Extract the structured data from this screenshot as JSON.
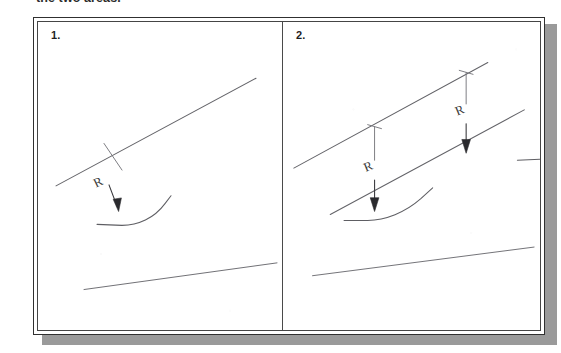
{
  "document": {
    "caption_clipped": "the two areas.",
    "background_color": "#ffffff",
    "ink_color": "#55555a",
    "frame_color": "#303030",
    "shadow_color": "#9a9a9a"
  },
  "figure": {
    "panels": [
      {
        "number": "1.",
        "description": "Single inclined line with one radius fillet annotated R",
        "annotations": [
          {
            "label": "R",
            "kind": "radius-callout"
          }
        ]
      },
      {
        "number": "2.",
        "description": "Two parallel inclined lines with two radius fillets each annotated R",
        "annotations": [
          {
            "label": "R",
            "kind": "radius-callout"
          },
          {
            "label": "R",
            "kind": "radius-callout"
          }
        ]
      }
    ]
  },
  "drawing": {
    "panel1": {
      "main_line": "M 18 166 L 218 57",
      "bottom_line": "M 46 271 L 239 244",
      "fillet_curve": "M 59 205 L 84 206 C 100 206 116 199 127 184 L 133 176",
      "leader_line": "M 84 150 L 66 123",
      "arrow_shaft": "M 72 164 L 80 189",
      "arrow_head": "M 80 191 L 76.2 180.5 L 84.2 179.5 Z",
      "r_label": {
        "x": 59,
        "y": 167,
        "rotate": -28,
        "text": "R"
      }
    },
    "panel2": {
      "upper_line": "M 48 148 L 240 43",
      "lower_line": "M 83 195 L 276 91",
      "bottom_line": "M 65 257 L 290 228",
      "fillet_a": "M 96 200 L 122 200 C 140 200 160 192 176 178 L 187 168",
      "fillet_b": "M 273 140 L 298 139 C 317 138 338 129 352 114 L 362 104",
      "leader_a": "M 112 179 L 128 146 L 128 110 L 139 102",
      "leader_b": "M 290 121 L 304 90 L 304 51 L 316 43",
      "arrow_a_shaft": "M 112 158 L 112 184",
      "arrow_a_head": "M 112 187 L 108 175 L 116 175 Z",
      "arrow_b_shaft": "M 290 100 L 290 125",
      "arrow_b_head": "M 290 128 L 286 116 L 294 116 Z",
      "r_label_a": {
        "x": 116,
        "y": 146,
        "rotate": -22,
        "text": "R"
      },
      "r_label_b": {
        "x": 294,
        "y": 88,
        "rotate": -22,
        "text": "R"
      }
    }
  }
}
